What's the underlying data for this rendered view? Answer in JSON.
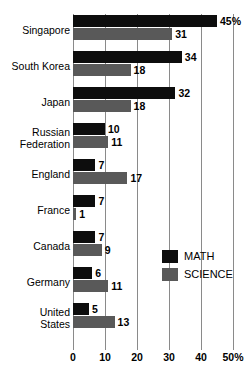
{
  "chart_data": {
    "type": "bar",
    "orientation": "horizontal",
    "title": "",
    "subtitle": "",
    "xlabel": "",
    "ylabel": "",
    "xlim": [
      0,
      50
    ],
    "grid": true,
    "legend_position": "middle-right",
    "xticks": [
      "0",
      "10",
      "20",
      "30",
      "40",
      "50%"
    ],
    "xtick_values": [
      0,
      10,
      20,
      30,
      40,
      50
    ],
    "categories": [
      "Singapore",
      "South Korea",
      "Japan",
      "Russian\nFederation",
      "England",
      "France",
      "Canada",
      "Germany",
      "United\nStates"
    ],
    "series": [
      {
        "name": "MATH",
        "color": "#0d0d0d",
        "values": [
          45,
          34,
          32,
          10,
          7,
          7,
          7,
          6,
          5
        ],
        "labels": [
          "45%",
          "34",
          "32",
          "10",
          "7",
          "7",
          "7",
          "6",
          "5"
        ]
      },
      {
        "name": "SCIENCE",
        "color": "#595959",
        "values": [
          31,
          18,
          18,
          11,
          17,
          1,
          9,
          11,
          13
        ],
        "labels": [
          "31",
          "18",
          "18",
          "11",
          "17",
          "1",
          "9",
          "11",
          "13"
        ]
      }
    ]
  },
  "legend": {
    "items": [
      {
        "label": "MATH",
        "color": "#0d0d0d"
      },
      {
        "label": "SCIENCE",
        "color": "#595959"
      }
    ]
  },
  "colors": {
    "math": "#0d0d0d",
    "science": "#595959",
    "gridline": "#8a8a8a",
    "background": "#ffffff",
    "text": "#000000"
  }
}
